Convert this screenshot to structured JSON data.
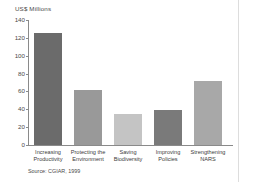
{
  "chart_data": {
    "type": "bar",
    "title": "",
    "xlabel": "",
    "ylabel": "US$ Millions",
    "ylim": [
      0,
      140
    ],
    "yticks": [
      140,
      120,
      100,
      80,
      60,
      40,
      20,
      0
    ],
    "grid": false,
    "legend": null,
    "categories": [
      "Increasing\nProductivity",
      "Protecting the\nEnvironment",
      "Saving\nBiodiversity",
      "Improving\nPolicies",
      "Strengthening\nNARS"
    ],
    "values": [
      125,
      62,
      35,
      39,
      72
    ],
    "bar_colors": [
      "#6b6b6b",
      "#999999",
      "#c4c4c4",
      "#7a7a7a",
      "#a8a8a8"
    ],
    "source": "Source: CGIAR, 1999"
  },
  "axis": {
    "y_title": "US$ Millions"
  }
}
